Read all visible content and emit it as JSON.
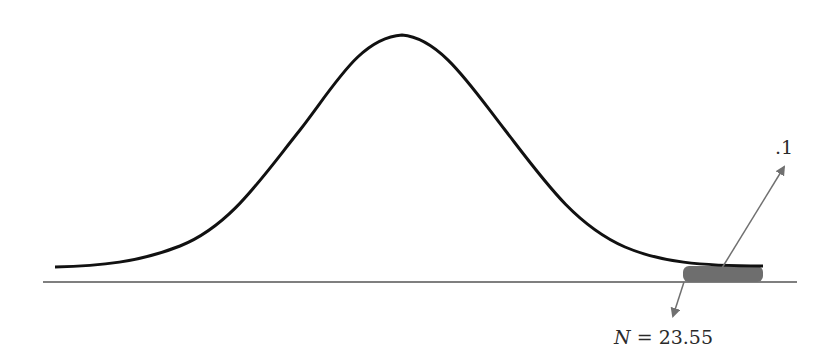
{
  "diagram": {
    "type": "normal-distribution-curve",
    "shaded_region": "right tail",
    "labels": {
      "tail_probability": ".1",
      "cutoff_variable": "N",
      "cutoff_equals": "=",
      "cutoff_value": "23.55"
    },
    "colors": {
      "curve": "#111111",
      "baseline": "#555555",
      "shade": "#6e6e6e",
      "arrow": "#707070"
    }
  }
}
